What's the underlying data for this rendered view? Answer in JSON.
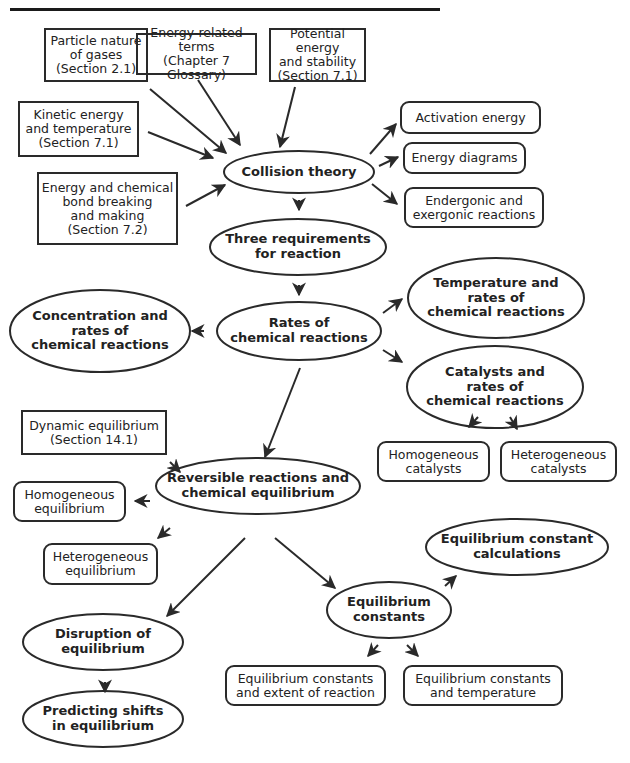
{
  "diagram": {
    "type": "concept-map",
    "nodes": {
      "particle_nature": {
        "label": "Particle nature\nof gases\n(Section 2.1)",
        "shape": "rectangle"
      },
      "energy_terms": {
        "label": "Energy-related terms\n(Chapter 7 Glossary)",
        "shape": "rectangle"
      },
      "potential_energy": {
        "label": "Potential energy\nand stability\n(Section 7.1)",
        "shape": "rectangle"
      },
      "kinetic_energy": {
        "label": "Kinetic energy\nand temperature\n(Section 7.1)",
        "shape": "rectangle"
      },
      "bond_energy": {
        "label": "Energy and chemical\nbond breaking\nand making\n(Section 7.2)",
        "shape": "rectangle"
      },
      "collision_theory": {
        "label": "Collision theory",
        "shape": "ellipse"
      },
      "activation_energy": {
        "label": "Activation energy",
        "shape": "rounded-rectangle"
      },
      "energy_diagrams": {
        "label": "Energy diagrams",
        "shape": "rounded-rectangle"
      },
      "endergonic": {
        "label": "Endergonic and\nexergonic reactions",
        "shape": "rounded-rectangle"
      },
      "three_requirements": {
        "label": "Three requirements\nfor reaction",
        "shape": "ellipse"
      },
      "rates": {
        "label": "Rates of\nchemical reactions",
        "shape": "ellipse"
      },
      "concentration": {
        "label": "Concentration and\nrates of\nchemical reactions",
        "shape": "ellipse"
      },
      "temperature_rates": {
        "label": "Temperature and\nrates of\nchemical reactions",
        "shape": "ellipse"
      },
      "catalysts": {
        "label": "Catalysts and\nrates of\nchemical reactions",
        "shape": "ellipse"
      },
      "homogeneous_catalysts": {
        "label": "Homogeneous\ncatalysts",
        "shape": "rounded-rectangle"
      },
      "heterogeneous_catalysts": {
        "label": "Heterogeneous\ncatalysts",
        "shape": "rounded-rectangle"
      },
      "dynamic_equilibrium": {
        "label": "Dynamic equilibrium\n(Section 14.1)",
        "shape": "rectangle"
      },
      "reversible": {
        "label": "Reversible reactions and\nchemical equilibrium",
        "shape": "ellipse"
      },
      "homogeneous_equilibrium": {
        "label": "Homogeneous\nequilibrium",
        "shape": "rounded-rectangle"
      },
      "heterogeneous_equilibrium": {
        "label": "Heterogeneous\nequilibrium",
        "shape": "rounded-rectangle"
      },
      "eq_constant_calc": {
        "label": "Equilibrium constant\ncalculations",
        "shape": "ellipse"
      },
      "eq_constants": {
        "label": "Equilibrium\nconstants",
        "shape": "ellipse"
      },
      "disruption": {
        "label": "Disruption of\nequilibrium",
        "shape": "ellipse"
      },
      "predicting_shifts": {
        "label": "Predicting shifts\nin equilibrium",
        "shape": "ellipse"
      },
      "eq_extent": {
        "label": "Equilibrium constants\nand extent of reaction",
        "shape": "rounded-rectangle"
      },
      "eq_temperature": {
        "label": "Equilibrium constants\nand temperature",
        "shape": "rounded-rectangle"
      }
    },
    "edges": [
      [
        "particle_nature",
        "collision_theory"
      ],
      [
        "energy_terms",
        "collision_theory"
      ],
      [
        "potential_energy",
        "collision_theory"
      ],
      [
        "kinetic_energy",
        "collision_theory"
      ],
      [
        "bond_energy",
        "collision_theory"
      ],
      [
        "collision_theory",
        "activation_energy"
      ],
      [
        "collision_theory",
        "energy_diagrams"
      ],
      [
        "collision_theory",
        "endergonic"
      ],
      [
        "collision_theory",
        "three_requirements"
      ],
      [
        "three_requirements",
        "rates"
      ],
      [
        "rates",
        "concentration"
      ],
      [
        "rates",
        "temperature_rates"
      ],
      [
        "rates",
        "catalysts"
      ],
      [
        "catalysts",
        "homogeneous_catalysts"
      ],
      [
        "catalysts",
        "heterogeneous_catalysts"
      ],
      [
        "rates",
        "reversible"
      ],
      [
        "dynamic_equilibrium",
        "reversible"
      ],
      [
        "reversible",
        "homogeneous_equilibrium"
      ],
      [
        "reversible",
        "heterogeneous_equilibrium"
      ],
      [
        "reversible",
        "disruption"
      ],
      [
        "reversible",
        "eq_constants"
      ],
      [
        "eq_constants",
        "eq_constant_calc"
      ],
      [
        "eq_constants",
        "eq_extent"
      ],
      [
        "eq_constants",
        "eq_temperature"
      ],
      [
        "disruption",
        "predicting_shifts"
      ]
    ]
  },
  "colors": {
    "line": "#2a2a2a",
    "background": "#ffffff",
    "text": "#222222"
  }
}
